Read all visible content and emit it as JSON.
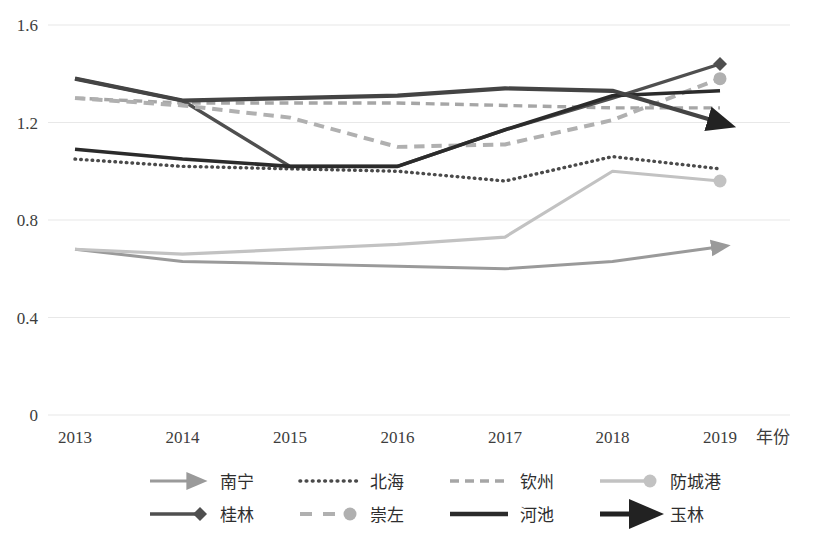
{
  "chart_data": {
    "type": "line",
    "title": "",
    "xlabel": "年份",
    "ylabel": "",
    "categories": [
      "2013",
      "2014",
      "2015",
      "2016",
      "2017",
      "2018",
      "2019"
    ],
    "yticks": [
      "0",
      "0.4",
      "0.8",
      "1.2",
      "1.6"
    ],
    "ylim": [
      0,
      1.6
    ],
    "grid": true,
    "legend_position": "bottom",
    "series": [
      {
        "name": "南宁",
        "values": [
          0.68,
          0.63,
          0.62,
          0.61,
          0.6,
          0.63,
          0.69
        ],
        "color": "#9a9a9a",
        "style": "solid",
        "width": 3,
        "marker": "arrow"
      },
      {
        "name": "北海",
        "values": [
          1.05,
          1.02,
          1.01,
          1.0,
          0.96,
          1.06,
          1.01
        ],
        "color": "#4a4a4a",
        "style": "dotted",
        "width": 3.4,
        "marker": "none"
      },
      {
        "name": "钦州",
        "values": [
          1.3,
          1.28,
          1.28,
          1.28,
          1.27,
          1.26,
          1.26
        ],
        "color": "#a6a6a6",
        "style": "dashed",
        "width": 3.4,
        "marker": "none"
      },
      {
        "name": "防城港",
        "values": [
          0.68,
          0.66,
          0.68,
          0.7,
          0.73,
          1.0,
          0.96
        ],
        "color": "#c2c2c2",
        "style": "solid",
        "width": 3.2,
        "marker": "circle"
      },
      {
        "name": "桂林",
        "values": [
          1.38,
          1.29,
          1.02,
          1.02,
          1.17,
          1.3,
          1.44
        ],
        "color": "#4f4f4f",
        "style": "solid",
        "width": 3.4,
        "marker": "diamond"
      },
      {
        "name": "崇左",
        "values": [
          1.3,
          1.27,
          1.22,
          1.1,
          1.11,
          1.21,
          1.38
        ],
        "color": "#b0b0b0",
        "style": "dashed",
        "width": 4,
        "marker": "circle"
      },
      {
        "name": "河池",
        "values": [
          1.09,
          1.05,
          1.02,
          1.02,
          1.17,
          1.31,
          1.33
        ],
        "color": "#2b2b2b",
        "style": "solid",
        "width": 3.6,
        "marker": "none"
      },
      {
        "name": "玉林",
        "values": [
          1.38,
          1.29,
          1.3,
          1.31,
          1.34,
          1.33,
          1.2
        ],
        "color": "#444444",
        "style": "solid",
        "width": 4.2,
        "marker": "arrow"
      }
    ]
  },
  "legend": {
    "rows": [
      [
        {
          "label": "南宁",
          "style": "solid-arrow",
          "color": "#9a9a9a"
        },
        {
          "label": "北海",
          "style": "dotted",
          "color": "#4a4a4a"
        },
        {
          "label": "钦州",
          "style": "dashed",
          "color": "#a6a6a6"
        },
        {
          "label": "防城港",
          "style": "solid-circle",
          "color": "#c2c2c2"
        }
      ],
      [
        {
          "label": "桂林",
          "style": "solid-diamond",
          "color": "#4f4f4f"
        },
        {
          "label": "崇左",
          "style": "dashed-circle",
          "color": "#b0b0b0"
        },
        {
          "label": "河池",
          "style": "solid-thick",
          "color": "#2b2b2b"
        },
        {
          "label": "玉林",
          "style": "solid-arrow-thick",
          "color": "#222222"
        }
      ]
    ]
  },
  "colors": {
    "grid": "#e8e8e8",
    "text": "#3d3d3d",
    "background": "#ffffff"
  }
}
